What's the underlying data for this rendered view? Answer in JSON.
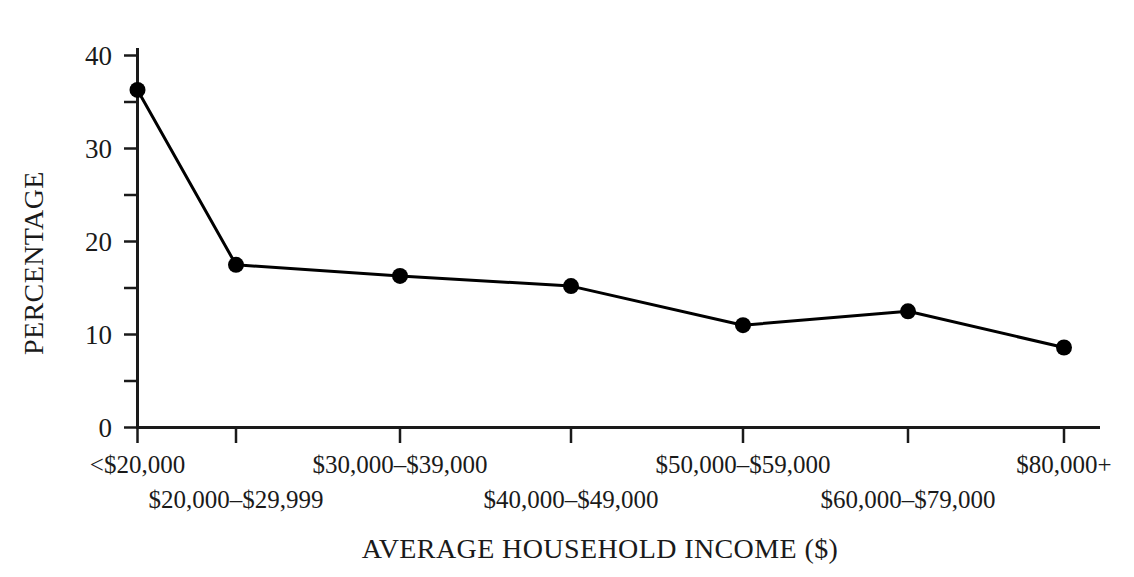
{
  "chart_data": {
    "type": "line",
    "title": "",
    "xlabel": "AVERAGE HOUSEHOLD INCOME ($)",
    "ylabel": "PERCENTAGE",
    "categories": [
      "<$20,000",
      "$20,000–$29,999",
      "$30,000–$39,000",
      "$40,000–$49,000",
      "$50,000–$59,000",
      "$60,000–$79,000",
      "$80,000+"
    ],
    "values": [
      36.3,
      17.5,
      16.3,
      15.2,
      11.0,
      12.5,
      8.6
    ],
    "ylim": [
      0,
      40
    ],
    "ytick_labels": [
      "0",
      "10",
      "20",
      "30",
      "40"
    ],
    "ytick_values": [
      0,
      10,
      20,
      30,
      40
    ],
    "yminor_tick_values": [
      5,
      15,
      25,
      35
    ],
    "grid": false,
    "legend": false,
    "legend_position": "none",
    "series_color": "#000000",
    "marker": "circle",
    "marker_size": 16,
    "line_width": 3
  },
  "style": {
    "background": "#ffffff",
    "axis_color": "#1a1a1a",
    "text_color": "#1a1a1a"
  }
}
